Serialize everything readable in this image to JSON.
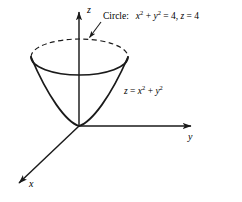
{
  "figure": {
    "type": "3d-coordinate-diagram",
    "background_color": "#ffffff",
    "stroke_color": "#000000",
    "width": 242,
    "height": 202
  },
  "axes": {
    "origin": {
      "x": 79,
      "y": 126
    },
    "z": {
      "label": "z",
      "direction": "up",
      "tip": {
        "x": 79,
        "y": 8
      }
    },
    "y": {
      "label": "y",
      "direction": "right",
      "tip": {
        "x": 195,
        "y": 126
      }
    },
    "x": {
      "label": "x",
      "direction": "down-left",
      "tip": {
        "x": 15,
        "y": 186
      }
    }
  },
  "surface": {
    "name": "paraboloid",
    "equation_label": {
      "lhs": "z",
      "equals": " = ",
      "term1_base": "x",
      "term1_exp": "2",
      "plus": " + ",
      "term2_base": "y",
      "term2_exp": "2"
    },
    "vertex": {
      "x": 79,
      "y": 126
    },
    "rim": {
      "center_x": 79.5,
      "center_y": 57,
      "radius_x": 48.5,
      "radius_y": 18,
      "back_half_style": "dashed",
      "front_half_style": "solid"
    }
  },
  "annotation": {
    "circle_label": {
      "title": "Circle:",
      "term1_base": "x",
      "term1_exp": "2",
      "plus": " + ",
      "term2_base": "y",
      "term2_exp": "2",
      "equals_four": " = 4",
      "comma": ", ",
      "z_var": "z",
      "z_value": " = 4"
    },
    "leader_line": {
      "from": {
        "x": 101,
        "y": 23
      },
      "to": {
        "x": 88,
        "y": 39
      },
      "arrowhead": "at-target"
    }
  },
  "colors": {
    "stroke": "#1a1a1a",
    "background": "#ffffff"
  }
}
